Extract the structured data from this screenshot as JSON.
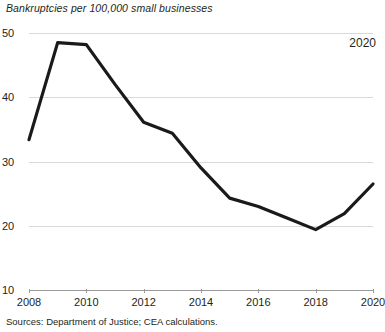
{
  "chart_data": {
    "type": "line",
    "title": "Bankruptcies per 100,000 small businesses",
    "xlabel": "",
    "ylabel": "",
    "x": [
      2008,
      2009,
      2010,
      2011,
      2012,
      2013,
      2014,
      2015,
      2016,
      2017,
      2018,
      2019,
      2020
    ],
    "values": [
      33.4,
      48.5,
      48.2,
      42.0,
      36.1,
      34.4,
      29.0,
      24.3,
      23.0,
      21.2,
      19.4,
      21.9,
      26.5
    ],
    "series": [
      {
        "name": "Bankruptcies per 100,000 small businesses",
        "values": [
          33.4,
          48.5,
          48.2,
          42.0,
          36.1,
          34.4,
          29.0,
          24.3,
          23.0,
          21.2,
          19.4,
          21.9,
          26.5
        ]
      }
    ],
    "ylim": [
      10,
      50
    ],
    "xlim": [
      2008,
      2020
    ],
    "yticks": [
      10,
      20,
      30,
      40,
      50
    ],
    "xticks": [
      2008,
      2010,
      2012,
      2014,
      2016,
      2018,
      2020
    ],
    "ytick_labels": [
      "10",
      "20",
      "30",
      "40",
      "50"
    ],
    "xtick_labels": [
      "2008",
      "2010",
      "2012",
      "2014",
      "2016",
      "2018",
      "2020"
    ],
    "grid": true,
    "grid_axis": "y",
    "legend": false,
    "line_color": "#1a1a1a",
    "line_width": 3.2,
    "annotations": [
      {
        "text": "2020",
        "x": 2020,
        "position": "top-right"
      }
    ],
    "source": "Sources: Department of Justice; CEA calculations."
  },
  "figure": {
    "title": "Bankruptcies per 100,000 small businesses",
    "annotation_label": "2020",
    "source_note": "Sources: Department of Justice; CEA calculations."
  }
}
